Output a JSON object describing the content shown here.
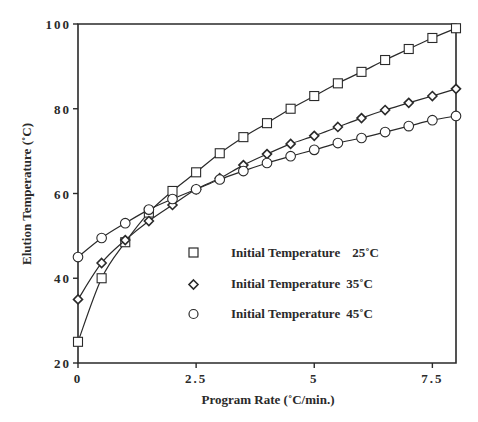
{
  "chart_data": {
    "type": "line",
    "title": "",
    "xlabel": "Program Rate (˚C/min.)",
    "ylabel": "Elution Temperature (˚C)",
    "xlim": [
      0,
      8
    ],
    "ylim": [
      20,
      100
    ],
    "x_ticks": [
      0,
      2.5,
      5,
      7.5
    ],
    "x_tick_labels": [
      "0",
      "2.5",
      "5",
      "7.5"
    ],
    "y_ticks": [
      20,
      40,
      60,
      80,
      100
    ],
    "y_tick_labels": [
      "20",
      "40",
      "60",
      "80",
      "100"
    ],
    "grid": false,
    "legend_position": "lower right (inside)",
    "x": [
      0,
      0.5,
      1.0,
      1.5,
      2.0,
      2.5,
      3.0,
      3.5,
      4.0,
      4.5,
      5.0,
      5.5,
      6.0,
      6.5,
      7.0,
      7.5,
      8.0
    ],
    "series": [
      {
        "name": "Initial Temperature 25˚C",
        "marker": "square",
        "values": [
          25,
          40,
          48.5,
          55.5,
          60.6,
          65,
          69.5,
          73.3,
          76.6,
          80,
          83,
          86,
          88.7,
          91.5,
          94.1,
          96.7,
          99
        ]
      },
      {
        "name": "Initial Temperature 35˚C",
        "marker": "diamond",
        "values": [
          35,
          43.6,
          49,
          53.5,
          57.3,
          61,
          63.6,
          66.7,
          69.3,
          71.7,
          73.6,
          75.7,
          77.8,
          79.7,
          81.4,
          83,
          84.7
        ]
      },
      {
        "name": "Initial Temperature 45˚C",
        "marker": "circle",
        "values": [
          45,
          49.5,
          53,
          56.2,
          58.7,
          61,
          63.3,
          65.3,
          67.2,
          68.8,
          70.3,
          71.9,
          73.1,
          74.5,
          75.9,
          77.3,
          78.3
        ]
      }
    ]
  },
  "legend": {
    "items": [
      {
        "label": "Initial Temperature",
        "value": "25˚C"
      },
      {
        "label": "Initial Temperature",
        "value": "35˚C"
      },
      {
        "label": "Initial Temperature",
        "value": "45˚C"
      }
    ]
  },
  "colors": {
    "ink": "#2a2a2a",
    "background": "#ffffff"
  }
}
